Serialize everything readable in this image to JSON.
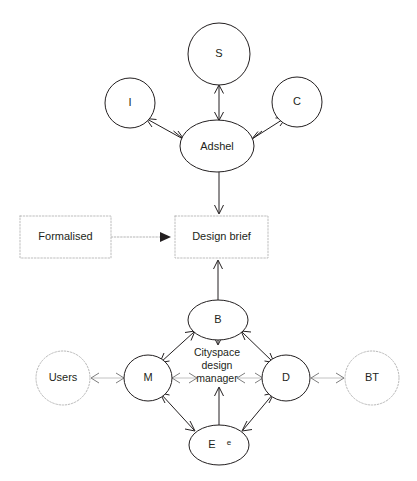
{
  "diagram": {
    "canvas": {
      "width": 417,
      "height": 481,
      "background": "#ffffff"
    },
    "colors": {
      "stroke_solid": "#231f20",
      "stroke_dotted": "#b9b9b9",
      "text": "#231f20",
      "faint_edge": "#c2c2c2"
    },
    "nodes": {
      "s": {
        "label": "S",
        "shape": "circle",
        "style": "solid",
        "cx": 219,
        "cy": 54,
        "r": 31
      },
      "i": {
        "label": "I",
        "shape": "circle",
        "style": "solid",
        "cx": 130,
        "cy": 103,
        "r": 25
      },
      "c": {
        "label": "C",
        "shape": "circle",
        "style": "solid",
        "cx": 297,
        "cy": 102,
        "r": 25
      },
      "adshel": {
        "label": "Adshel",
        "shape": "ellipse",
        "style": "solid",
        "cx": 217,
        "cy": 146,
        "rx": 37,
        "ry": 26
      },
      "formalised": {
        "label": "Formalised",
        "shape": "rect",
        "style": "dotted",
        "x": 20,
        "y": 216,
        "w": 91,
        "h": 42
      },
      "design_brief": {
        "label": "Design brief",
        "shape": "rect",
        "style": "dotted",
        "x": 175,
        "y": 216,
        "w": 93,
        "h": 42
      },
      "b": {
        "label": "B",
        "shape": "ellipse",
        "style": "solid",
        "cx": 218,
        "cy": 320,
        "rx": 30,
        "ry": 20
      },
      "m": {
        "label": "M",
        "shape": "ellipse",
        "style": "solid",
        "cx": 148,
        "cy": 378,
        "rx": 24,
        "ry": 23
      },
      "d": {
        "label": "D",
        "shape": "ellipse",
        "style": "solid",
        "cx": 286,
        "cy": 378,
        "rx": 24,
        "ry": 23
      },
      "e": {
        "label": "E",
        "sublabel": "e",
        "shape": "ellipse",
        "style": "solid",
        "cx": 219,
        "cy": 445,
        "rx": 30,
        "ry": 20
      },
      "users": {
        "label": "Users",
        "shape": "circle",
        "style": "dotted",
        "cx": 63,
        "cy": 378,
        "r": 27
      },
      "bt": {
        "label": "BT",
        "shape": "circle",
        "style": "dotted",
        "cx": 372,
        "cy": 378,
        "r": 27
      }
    },
    "center_label": {
      "lines": [
        "Cityspace",
        "design",
        "manager"
      ],
      "cx": 217,
      "cy": 356
    },
    "edges": [
      {
        "id": "adshel-s",
        "from": "adshel",
        "to": "s",
        "style": "solid",
        "arrows": "both"
      },
      {
        "id": "adshel-i",
        "from": "adshel",
        "to": "i",
        "style": "solid",
        "arrows": "both"
      },
      {
        "id": "adshel-c",
        "from": "adshel",
        "to": "c",
        "style": "solid",
        "arrows": "both"
      },
      {
        "id": "adshel-design-brief",
        "from": "adshel",
        "to": "design_brief",
        "style": "solid",
        "arrows": "end"
      },
      {
        "id": "formalised-design-brief",
        "from": "formalised",
        "to": "design_brief",
        "style": "dotted",
        "arrows": "end-filled"
      },
      {
        "id": "b-design-brief",
        "from": "b",
        "to": "design_brief",
        "style": "solid",
        "arrows": "end"
      },
      {
        "id": "b-center",
        "from": "b",
        "to": "center",
        "style": "solid",
        "arrows": "end-hollow"
      },
      {
        "id": "m-b",
        "from": "m",
        "to": "b",
        "style": "solid",
        "arrows": "both"
      },
      {
        "id": "d-b",
        "from": "d",
        "to": "b",
        "style": "solid",
        "arrows": "both"
      },
      {
        "id": "m-e",
        "from": "m",
        "to": "e",
        "style": "solid",
        "arrows": "both"
      },
      {
        "id": "d-e",
        "from": "d",
        "to": "e",
        "style": "solid",
        "arrows": "both"
      },
      {
        "id": "e-center",
        "from": "e",
        "to": "center",
        "style": "solid",
        "arrows": "end"
      },
      {
        "id": "m-center",
        "from": "m",
        "to": "center",
        "style": "faint",
        "arrows": "both"
      },
      {
        "id": "d-center",
        "from": "d",
        "to": "center",
        "style": "faint",
        "arrows": "both"
      },
      {
        "id": "users-m",
        "from": "users",
        "to": "m",
        "style": "faint",
        "arrows": "both"
      },
      {
        "id": "d-bt",
        "from": "d",
        "to": "bt",
        "style": "faint",
        "arrows": "both"
      }
    ]
  }
}
